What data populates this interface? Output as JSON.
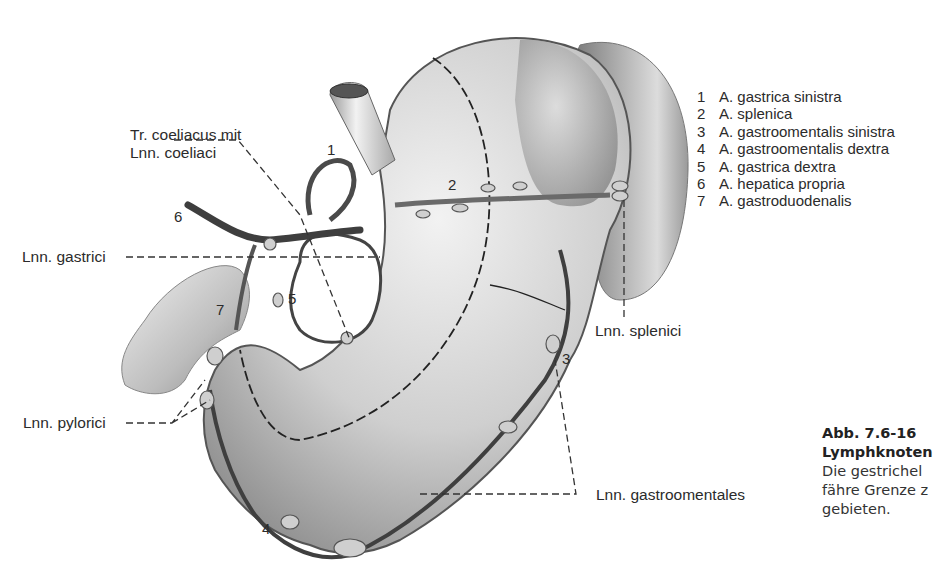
{
  "figure": {
    "colors": {
      "background": "#ffffff",
      "ink": "#2b2b2b",
      "tissue_light": "#e6e6e6",
      "tissue_dark": "#8a8a8a",
      "vessel": "#555555"
    }
  },
  "labels": {
    "tr_coeliacus_line1": "Tr. coeliacus mit",
    "tr_coeliacus_line2": "Lnn. coeliaci",
    "lnn_gastrici": "Lnn. gastrici",
    "lnn_pylorici": "Lnn. pylorici",
    "lnn_splenici": "Lnn. splenici",
    "lnn_gastroomentales": "Lnn. gastroomentales"
  },
  "numbers": {
    "n1": "1",
    "n2": "2",
    "n3": "3",
    "n4": "4",
    "n5": "5",
    "n6": "6",
    "n7": "7"
  },
  "legend": [
    {
      "num": "1",
      "text": "A. gastrica sinistra"
    },
    {
      "num": "2",
      "text": "A. splenica"
    },
    {
      "num": "3",
      "text": "A. gastroomentalis sinistra"
    },
    {
      "num": "4",
      "text": "A. gastroomentalis dextra"
    },
    {
      "num": "5",
      "text": "A. gastrica dextra"
    },
    {
      "num": "6",
      "text": "A. hepatica propria"
    },
    {
      "num": "7",
      "text": "A. gastroduodenalis"
    }
  ],
  "caption": {
    "figure_number": "Abb. 7.6-16",
    "title_partial": "Lymphknoten",
    "line1_partial": "Die gestrichel",
    "line2_partial": "fähre Grenze z",
    "line3": "gebieten."
  }
}
